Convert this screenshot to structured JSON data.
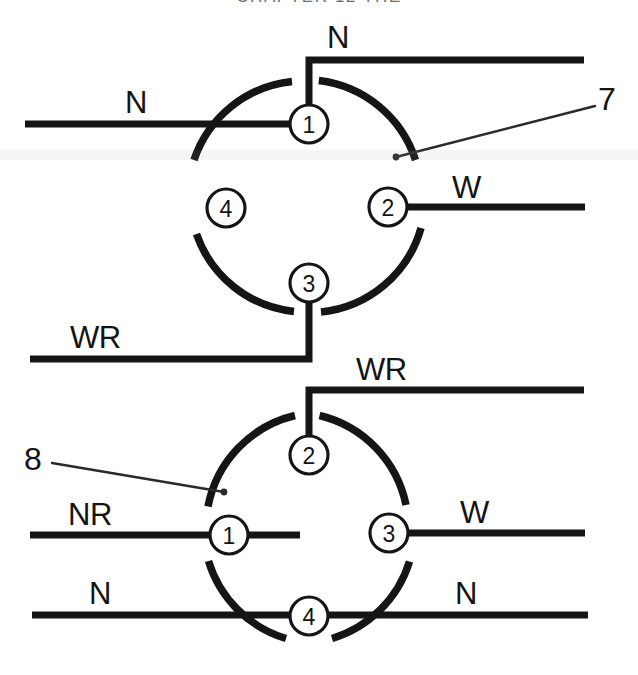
{
  "page": {
    "width": 638,
    "height": 675,
    "background": "#ffffff",
    "ink_color": "#151515",
    "header_text": "CHAPTER 12  THE"
  },
  "diagram": {
    "connectors": [
      {
        "id": "upper-connector",
        "callout": "7",
        "terminals": [
          {
            "number": "1",
            "position": "top",
            "wire_label": "N"
          },
          {
            "number": "2",
            "position": "right",
            "wire_label": "W"
          },
          {
            "number": "3",
            "position": "bottom",
            "wire_label": "WR"
          },
          {
            "number": "4",
            "position": "left",
            "wire_label": ""
          }
        ],
        "wire_labels": {
          "top": "N",
          "left": "N",
          "right": "W",
          "bottom": "WR"
        }
      },
      {
        "id": "lower-connector",
        "callout": "8",
        "terminals": [
          {
            "number": "2",
            "position": "top",
            "wire_label": "WR"
          },
          {
            "number": "1",
            "position": "left",
            "wire_label": "NR"
          },
          {
            "number": "3",
            "position": "right",
            "wire_label": "W"
          },
          {
            "number": "4",
            "position": "bottom",
            "wire_label": "N"
          }
        ],
        "wire_labels": {
          "top": "WR",
          "left": "NR",
          "right": "W",
          "bottom_left": "N",
          "bottom_right": "N"
        }
      }
    ]
  },
  "labels": {
    "upper": {
      "top_n": "N",
      "left_n": "N",
      "right_w": "W",
      "bottom_wr": "WR",
      "callout_7": "7",
      "term_1": "1",
      "term_2": "2",
      "term_3": "3",
      "term_4": "4"
    },
    "lower": {
      "top_wr": "WR",
      "left_nr": "NR",
      "right_w": "W",
      "bottom_left_n": "N",
      "bottom_right_n": "N",
      "callout_8": "8",
      "term_1": "1",
      "term_2": "2",
      "term_3": "3",
      "term_4": "4"
    }
  }
}
